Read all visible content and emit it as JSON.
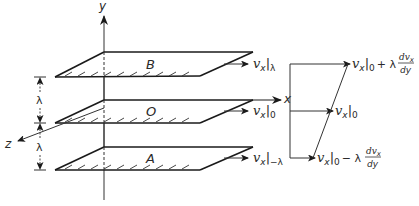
{
  "diagram": {
    "type": "fluid-shear-layers",
    "axes": {
      "y": "y",
      "x": "x",
      "z": "z"
    },
    "plates": [
      {
        "id": "B",
        "label": "B"
      },
      {
        "id": "O",
        "label": "O"
      },
      {
        "id": "A",
        "label": "A"
      }
    ],
    "spacing": {
      "upper": "λ",
      "lower": "λ"
    },
    "velocity_labels": {
      "top": {
        "v": "v",
        "sub": "x",
        "bar_sub": "λ"
      },
      "mid": {
        "v": "v",
        "sub": "x",
        "bar_sub": "0"
      },
      "bot": {
        "v": "v",
        "sub": "x",
        "bar_sub": "−λ"
      }
    },
    "profile_labels": {
      "top": {
        "v": "v",
        "sub": "x",
        "bar_sub": "0",
        "op": "+ λ",
        "num": "dv",
        "num_sub": "x",
        "den": "dy"
      },
      "mid": {
        "v": "v",
        "sub": "x",
        "bar_sub": "0"
      },
      "bot": {
        "v": "v",
        "sub": "x",
        "bar_sub": "0",
        "op": "− λ",
        "num": "dv",
        "num_sub": "x",
        "den": "dy"
      }
    },
    "colors": {
      "line": "#1a1a1a",
      "thin": "#333333",
      "background": "#ffffff"
    }
  }
}
